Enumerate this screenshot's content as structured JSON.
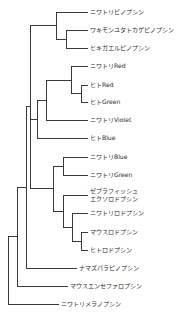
{
  "figure": {
    "type": "phylogenetic-tree",
    "style": "cladogram",
    "line_color": "#3a3a3a",
    "text_color": "#2b2b2b",
    "background_color": "#ffffff",
    "width": 188,
    "height": 314
  },
  "leaves": [
    {
      "id": "chicken-pinopsin",
      "label": "ニワトリピノプシン",
      "y": 12,
      "branch_x": 88
    },
    {
      "id": "lizard-pinopsin",
      "label": "ワキモンユタトカゲピノプシン",
      "y": 30,
      "branch_x": 88
    },
    {
      "id": "toad-pinopsin",
      "label": "ヒキガエルピノプシン",
      "y": 48,
      "branch_x": 88
    },
    {
      "id": "chicken-red",
      "label": "ニワトリRed",
      "y": 66,
      "branch_x": 88
    },
    {
      "id": "human-red",
      "label": "ヒトRed",
      "y": 85,
      "branch_x": 88
    },
    {
      "id": "human-green",
      "label": "ヒトGreen",
      "y": 102,
      "branch_x": 88
    },
    {
      "id": "chicken-violet",
      "label": "ニワトリViolet",
      "y": 120,
      "branch_x": 88
    },
    {
      "id": "human-blue",
      "label": "ヒトBlue",
      "y": 138,
      "branch_x": 88
    },
    {
      "id": "chicken-blue",
      "label": "ニワトリBlue",
      "y": 157,
      "branch_x": 88
    },
    {
      "id": "chicken-green",
      "label": "ニワトリGreen",
      "y": 175,
      "branch_x": 88
    },
    {
      "id": "zebrafish-exorhodopsin",
      "label": "ゼブラフィッシュ\nエクソロドプシン",
      "y": 195,
      "branch_x": 88,
      "lines": 2
    },
    {
      "id": "chicken-rhodopsin",
      "label": "ニワトリロドプシン",
      "y": 213,
      "branch_x": 88
    },
    {
      "id": "mouse-rhodopsin",
      "label": "マウスロドプシン",
      "y": 232,
      "branch_x": 88
    },
    {
      "id": "human-rhodopsin",
      "label": "ヒトロドプシン",
      "y": 250,
      "branch_x": 88
    },
    {
      "id": "catfish-parapinopsin",
      "label": "ナマズパラピノプシン",
      "y": 268,
      "branch_x": 77
    },
    {
      "id": "mouse-encephalopsin",
      "label": "マウスエンセファロプシン",
      "y": 286,
      "branch_x": 68
    },
    {
      "id": "chicken-melanopsin",
      "label": "ニワトリメラノプシン",
      "y": 304,
      "branch_x": 59
    }
  ],
  "branch_paths": [
    {
      "id": "leaf-branch-chicken-pinopsin",
      "d": "M 56 12 L 88 12"
    },
    {
      "id": "leaf-branch-lizard-pinopsin",
      "d": "M 66 30 L 88 30"
    },
    {
      "id": "leaf-branch-toad-pinopsin",
      "d": "M 66 48 L 88 48"
    },
    {
      "id": "node-lizard-toad-vertical",
      "d": "M 66 30 L 66 48"
    },
    {
      "id": "node-lizard-toad-stem",
      "d": "M 56 39 L 66 39"
    },
    {
      "id": "node-pinopsin-vertical",
      "d": "M 56 12 L 56 39"
    },
    {
      "id": "node-pinopsin-stem",
      "d": "M 30 25 L 56 25"
    },
    {
      "id": "leaf-branch-chicken-red",
      "d": "M 71 66 L 88 66"
    },
    {
      "id": "leaf-branch-human-red",
      "d": "M 81 85 L 88 85"
    },
    {
      "id": "leaf-branch-human-green",
      "d": "M 81 102 L 88 102"
    },
    {
      "id": "node-human-rg-vertical",
      "d": "M 81 85 L 81 102"
    },
    {
      "id": "node-human-rg-stem",
      "d": "M 71 93 L 81 93"
    },
    {
      "id": "node-lws-vertical",
      "d": "M 71 66 L 71 93"
    },
    {
      "id": "node-lws-stem",
      "d": "M 46 80 L 71 80"
    },
    {
      "id": "leaf-branch-chicken-violet",
      "d": "M 46 120 L 88 120"
    },
    {
      "id": "node-sws1-lws-vertical",
      "d": "M 46 80 L 46 120"
    },
    {
      "id": "node-sws1-lws-stem",
      "d": "M 37 100 L 46 100"
    },
    {
      "id": "leaf-branch-human-blue",
      "d": "M 37 138 L 88 138"
    },
    {
      "id": "node-sws2-vertical",
      "d": "M 37 100 L 37 138"
    },
    {
      "id": "node-sws2-stem",
      "d": "M 30 119 L 37 119"
    },
    {
      "id": "leaf-branch-chicken-blue",
      "d": "M 63 157 L 88 157"
    },
    {
      "id": "leaf-branch-chicken-green",
      "d": "M 63 175 L 88 175"
    },
    {
      "id": "node-blue-green-vertical",
      "d": "M 63 157 L 63 175"
    },
    {
      "id": "node-blue-green-stem",
      "d": "M 53 166 L 63 166"
    },
    {
      "id": "leaf-branch-zebrafish-exorhodopsin",
      "d": "M 63 195 L 88 195"
    },
    {
      "id": "leaf-branch-chicken-rhodopsin",
      "d": "M 72 213 L 88 213"
    },
    {
      "id": "leaf-branch-mouse-rhodopsin",
      "d": "M 81 232 L 88 232"
    },
    {
      "id": "leaf-branch-human-rhodopsin",
      "d": "M 81 250 L 88 250"
    },
    {
      "id": "node-mammal-rh-vertical",
      "d": "M 81 232 L 81 250"
    },
    {
      "id": "node-mammal-rh-stem",
      "d": "M 72 241 L 81 241"
    },
    {
      "id": "node-rh-inner-vertical",
      "d": "M 72 213 L 72 241"
    },
    {
      "id": "node-rh-inner-stem",
      "d": "M 63 227 L 72 227"
    },
    {
      "id": "node-rh-outer-vertical",
      "d": "M 63 195 L 63 227"
    },
    {
      "id": "node-rh-outer-stem",
      "d": "M 53 211 L 63 211"
    },
    {
      "id": "node-rh-clade-vertical",
      "d": "M 53 166 L 53 211"
    },
    {
      "id": "node-rh-clade-stem",
      "d": "M 30 188 L 53 188"
    },
    {
      "id": "node-main-vertical",
      "d": "M 30 25 L 30 188"
    },
    {
      "id": "node-main-stem",
      "d": "M 26 106 L 30 106"
    },
    {
      "id": "leaf-branch-catfish-parapinopsin",
      "d": "M 26 268 L 77 268"
    },
    {
      "id": "node-parapinopsin-vertical",
      "d": "M 26 106 L 26 268"
    },
    {
      "id": "node-parapinopsin-stem",
      "d": "M 17 187 L 26 187"
    },
    {
      "id": "leaf-branch-mouse-encephalopsin",
      "d": "M 17 286 L 68 286"
    },
    {
      "id": "node-encephalopsin-vertical",
      "d": "M 17 187 L 17 286"
    },
    {
      "id": "node-encephalopsin-stem",
      "d": "M 8 236 L 17 236"
    },
    {
      "id": "leaf-branch-chicken-melanopsin",
      "d": "M 8 304 L 59 304"
    },
    {
      "id": "node-root-vertical",
      "d": "M 8 236 L 8 304"
    }
  ]
}
